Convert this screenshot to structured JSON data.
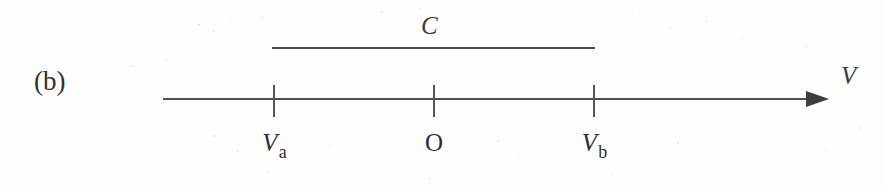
{
  "figure": {
    "panel_tag": "(b)",
    "set_label": "C",
    "axis_variable": "V",
    "width_px": 885,
    "height_px": 186,
    "background_color": "#fdfdfd",
    "ink_color": "#2e2e2e",
    "line_color": "#4f4f4f"
  },
  "axis": {
    "start_x": 163,
    "end_x": 828,
    "y": 99,
    "arrow_direction": "right",
    "has_arrowhead": true
  },
  "span_bar": {
    "label": "C",
    "start_x": 272,
    "end_x": 595,
    "y": 48,
    "description": "horizontal bar spanning from Va to Vb labelled C"
  },
  "ticks": [
    {
      "id": "tick-va",
      "x": 274,
      "label_variable": "V",
      "label_subscript": "a",
      "label_style": "italic",
      "label_text": "Va"
    },
    {
      "id": "tick-origin",
      "x": 434,
      "label_variable": "O",
      "label_subscript": "",
      "label_style": "upright",
      "label_text": "O"
    },
    {
      "id": "tick-vb",
      "x": 594,
      "label_variable": "V",
      "label_subscript": "b",
      "label_style": "italic",
      "label_text": "Vb"
    }
  ]
}
